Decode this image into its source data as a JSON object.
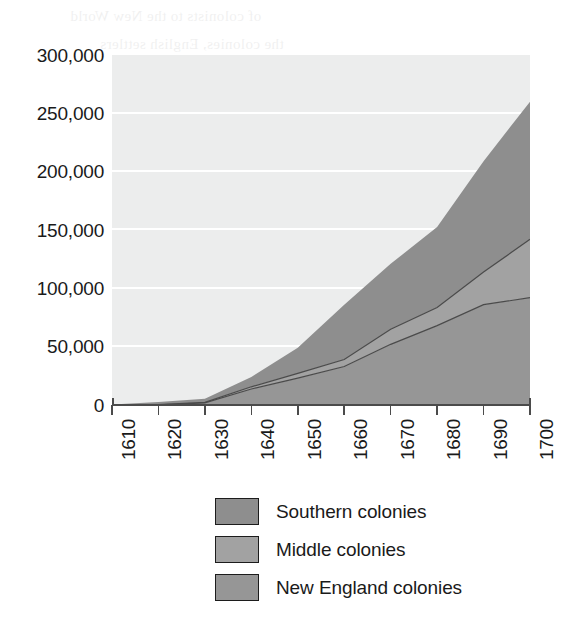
{
  "chart_data": {
    "type": "area",
    "stacked": true,
    "title": "",
    "subtitle": "",
    "xlabel": "",
    "ylabel": "",
    "x": [
      1610,
      1620,
      1630,
      1640,
      1650,
      1660,
      1670,
      1680,
      1690,
      1700
    ],
    "categories": [
      "1610",
      "1620",
      "1630",
      "1640",
      "1650",
      "1660",
      "1670",
      "1680",
      "1690",
      "1700"
    ],
    "series": [
      {
        "name": "New England colonies",
        "values": [
          0,
          100,
          1800,
          13700,
          23000,
          33000,
          52000,
          68000,
          86000,
          92000
        ],
        "color": "#9a9a9a",
        "stack_order": 1
      },
      {
        "name": "Middle colonies",
        "values": [
          200,
          350,
          500,
          1900,
          4100,
          6000,
          13000,
          15500,
          28000,
          50000
        ],
        "color": "#9e9e9e",
        "stack_order": 2
      },
      {
        "name": "Southern colonies",
        "values": [
          150,
          2200,
          3000,
          8400,
          22000,
          47000,
          56000,
          69000,
          95000,
          118000
        ],
        "color": "#8e8e8e",
        "stack_order": 3
      }
    ],
    "stack_totals": [
      350,
      2650,
      5300,
      24000,
      49100,
      86000,
      121000,
      152500,
      209000,
      260000
    ],
    "cumulative_boundaries": {
      "new_england_top": [
        0,
        100,
        1800,
        13700,
        23000,
        33000,
        52000,
        68000,
        86000,
        92000
      ],
      "middle_top": [
        200,
        450,
        2300,
        15600,
        27100,
        39000,
        65000,
        83500,
        114000,
        142000
      ],
      "southern_top": [
        350,
        2650,
        5300,
        24000,
        49100,
        86000,
        121000,
        152500,
        209000,
        260000
      ]
    },
    "ylim": [
      0,
      300000
    ],
    "xlim": [
      1610,
      1700
    ],
    "yticks": [
      0,
      50000,
      100000,
      150000,
      200000,
      250000,
      300000
    ],
    "ytick_labels": [
      "0",
      "50,000",
      "100,000",
      "150,000",
      "200,000",
      "250,000",
      "300,000"
    ],
    "xtick_labels": [
      "1610",
      "1620",
      "1630",
      "1640",
      "1650",
      "1660",
      "1670",
      "1680",
      "1690",
      "1700"
    ],
    "grid": true,
    "grid_color": "#ffffff",
    "plot_background": "#eceded",
    "legend_position": "bottom-center",
    "legend_entries": [
      {
        "label": "Southern colonies",
        "color": "#8e8e8e"
      },
      {
        "label": "Middle colonies",
        "color": "#a2a2a2"
      },
      {
        "label": "New England colonies",
        "color": "#969696"
      }
    ]
  },
  "axis": {
    "y_labels": [
      "300,000",
      "250,000",
      "200,000",
      "150,000",
      "100,000",
      "50,000",
      "0"
    ],
    "x_labels": [
      "1610",
      "1620",
      "1630",
      "1640",
      "1650",
      "1660",
      "1670",
      "1680",
      "1690",
      "1700"
    ]
  },
  "legend": {
    "rows": [
      {
        "label": "Southern colonies"
      },
      {
        "label": "Middle colonies"
      },
      {
        "label": "New England colonies"
      }
    ]
  },
  "colors": {
    "southern": "#8e8e8e",
    "middle": "#a2a2a2",
    "new_england": "#969696",
    "plot_bg": "#eceded",
    "grid": "#ffffff",
    "axis": "#4b4b4b",
    "text": "#1a1a1a"
  },
  "bleed_through": {
    "lines": [
      "of colonists to the New World",
      "the colonies, English settlers",
      "colonies of the English crown",
      "the demands of a growing",
      "as the popula",
      "ons from the provinces",
      "gan to settle more of"
    ]
  }
}
